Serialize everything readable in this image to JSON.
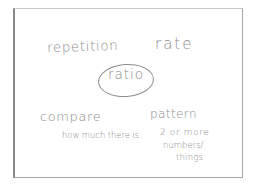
{
  "concept_map": {
    "center": "ratio",
    "top_left": "repetition",
    "top_right": "rate",
    "bottom_left": {
      "label": "compare",
      "note": "how much there is"
    },
    "bottom_right": {
      "label": "pattern",
      "note_lines": [
        "2 or more",
        "numbers/",
        "things"
      ]
    }
  },
  "colors": {
    "ink": "#8c8c8c",
    "paper": "#ffffff",
    "border": "#a8a8a8"
  }
}
